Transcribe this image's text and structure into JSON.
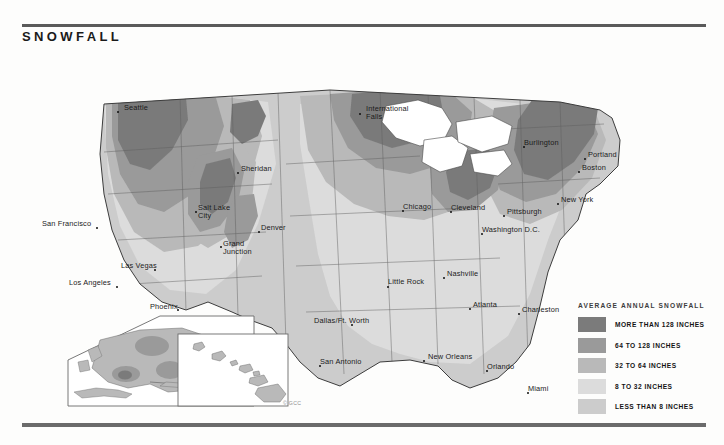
{
  "page": {
    "title": "SNOWFALL",
    "copyright": "© GCC",
    "background": "#fdfdfc",
    "rule_color": "#5a5a5a"
  },
  "legend": {
    "title": "AVERAGE ANNUAL SNOWFALL",
    "entries": [
      {
        "label": "MORE THAN 128 INCHES",
        "color": "#7b7b7b",
        "min_inches": 128,
        "max_inches": null
      },
      {
        "label": "64 TO 128 INCHES",
        "color": "#9a9a9a",
        "min_inches": 64,
        "max_inches": 128
      },
      {
        "label": "32 TO 64 INCHES",
        "color": "#b9b9b9",
        "min_inches": 32,
        "max_inches": 64
      },
      {
        "label": "8 TO 32 INCHES",
        "color": "#dcdcdc",
        "min_inches": 8,
        "max_inches": 32
      },
      {
        "label": "LESS THAN 8 INCHES",
        "color": "#cccccc",
        "min_inches": 0,
        "max_inches": 8
      }
    ]
  },
  "map": {
    "projection_note": "contiguous United States with Alaska and Hawaii insets",
    "insets": [
      {
        "name": "alaska-inset"
      },
      {
        "name": "hawaii-inset"
      }
    ],
    "cities": [
      {
        "name": "Seattle",
        "label": "Seattle",
        "x": 118,
        "y": 68,
        "dx": 6,
        "dy": -4,
        "lines": 1
      },
      {
        "name": "San Francisco",
        "label": "San Francisco",
        "x": 97,
        "y": 184,
        "dx": -55,
        "dy": -4,
        "lines": 1
      },
      {
        "name": "Los Angeles",
        "label": "Los Angeles",
        "x": 117,
        "y": 243,
        "dx": -48,
        "dy": -4,
        "lines": 1
      },
      {
        "name": "Las Vegas",
        "label": "Las Vegas",
        "x": 155,
        "y": 226,
        "dx": -34,
        "dy": -4,
        "lines": 1
      },
      {
        "name": "Phoenix",
        "label": "Phoenix",
        "x": 178,
        "y": 266,
        "dx": -28,
        "dy": -3,
        "lines": 1
      },
      {
        "name": "Salt Lake City",
        "label": "Salt Lake City",
        "x": 196,
        "y": 168,
        "dx": 2,
        "dy": -4,
        "lines": 2
      },
      {
        "name": "Grand Junction",
        "label": "Grand Junction",
        "x": 221,
        "y": 203,
        "dx": 2,
        "dy": -3,
        "lines": 2
      },
      {
        "name": "Sheridan",
        "label": "Sheridan",
        "x": 238,
        "y": 129,
        "dx": 3,
        "dy": -4,
        "lines": 1
      },
      {
        "name": "Denver",
        "label": "Denver",
        "x": 259,
        "y": 188,
        "dx": 2,
        "dy": -4,
        "lines": 1
      },
      {
        "name": "International Falls",
        "label": "International Falls",
        "x": 360,
        "y": 70,
        "dx": 6,
        "dy": -5,
        "lines": 2
      },
      {
        "name": "Chicago",
        "label": "Chicago",
        "x": 403,
        "y": 167,
        "dx": 0,
        "dy": -4,
        "lines": 1
      },
      {
        "name": "Cleveland",
        "label": "Cleveland",
        "x": 451,
        "y": 168,
        "dx": 0,
        "dy": -4,
        "lines": 1
      },
      {
        "name": "Pittsburgh",
        "label": "Pittsburgh",
        "x": 504,
        "y": 172,
        "dx": 3,
        "dy": -4,
        "lines": 1
      },
      {
        "name": "Washington D.C.",
        "label": "Washington D.C.",
        "x": 482,
        "y": 190,
        "dx": 0,
        "dy": -4,
        "lines": 1
      },
      {
        "name": "New York",
        "label": "New York",
        "x": 558,
        "y": 160,
        "dx": 3,
        "dy": -4,
        "lines": 1
      },
      {
        "name": "Burlington",
        "label": "Burlington",
        "x": 524,
        "y": 103,
        "dx": 0,
        "dy": -4,
        "lines": 1
      },
      {
        "name": "Portland",
        "label": "Portland",
        "x": 585,
        "y": 115,
        "dx": 3,
        "dy": -4,
        "lines": 1
      },
      {
        "name": "Boston",
        "label": "Boston",
        "x": 579,
        "y": 128,
        "dx": 3,
        "dy": -4,
        "lines": 1
      },
      {
        "name": "Nashville",
        "label": "Nashville",
        "x": 444,
        "y": 234,
        "dx": 3,
        "dy": -4,
        "lines": 1
      },
      {
        "name": "Little Rock",
        "label": "Little Rock",
        "x": 388,
        "y": 243,
        "dx": 0,
        "dy": -5,
        "lines": 2
      },
      {
        "name": "Atlanta",
        "label": "Atlanta",
        "x": 470,
        "y": 265,
        "dx": 3,
        "dy": -4,
        "lines": 1
      },
      {
        "name": "Charleston",
        "label": "Charleston",
        "x": 519,
        "y": 270,
        "dx": 3,
        "dy": -4,
        "lines": 1
      },
      {
        "name": "Dallas/Ft. Worth",
        "label": "Dallas/Ft. Worth",
        "x": 352,
        "y": 281,
        "dx": -38,
        "dy": -4,
        "lines": 1
      },
      {
        "name": "San Antonio",
        "label": "San Antonio",
        "x": 320,
        "y": 322,
        "dx": 0,
        "dy": -4,
        "lines": 1
      },
      {
        "name": "New Orleans",
        "label": "New Orleans",
        "x": 424,
        "y": 317,
        "dx": 4,
        "dy": -4,
        "lines": 1
      },
      {
        "name": "Orlando",
        "label": "Orlando",
        "x": 487,
        "y": 327,
        "dx": 0,
        "dy": -4,
        "lines": 1
      },
      {
        "name": "Miami",
        "label": "Miami",
        "x": 528,
        "y": 349,
        "dx": 0,
        "dy": -4,
        "lines": 1
      }
    ]
  }
}
